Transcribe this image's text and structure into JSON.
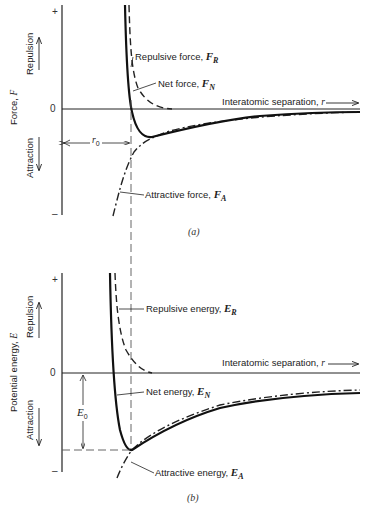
{
  "panel_a": {
    "caption": "(a)",
    "y_axis_label": "Force, ",
    "y_axis_symbol": "F",
    "repulsion_label": "Repulsion",
    "attraction_label": "Attraction",
    "tick_plus": "+",
    "tick_zero": "0",
    "tick_minus": "–",
    "x_axis_label": "Interatomic separation, ",
    "x_axis_symbol": "r",
    "curves": {
      "repulsive": {
        "label": "Repulsive force, ",
        "symbol": "F",
        "subscript": "R",
        "style": "dashed"
      },
      "net": {
        "label": "Net force, ",
        "symbol": "F",
        "subscript": "N",
        "style": "solid"
      },
      "attractive": {
        "label": "Attractive force, ",
        "symbol": "F",
        "subscript": "A",
        "style": "dash-dot"
      }
    },
    "equilibrium_label": "r",
    "equilibrium_subscript": "0"
  },
  "panel_b": {
    "caption": "(b)",
    "y_axis_label": "Potential energy, ",
    "y_axis_symbol": "E",
    "repulsion_label": "Repulsion",
    "attraction_label": "Attraction",
    "tick_plus": "+",
    "tick_zero": "0",
    "tick_minus": "–",
    "x_axis_label": "Interatomic separation, ",
    "x_axis_symbol": "r",
    "curves": {
      "repulsive": {
        "label": "Repulsive energy, ",
        "symbol": "E",
        "subscript": "R",
        "style": "dashed"
      },
      "net": {
        "label": "Net energy, ",
        "symbol": "E",
        "subscript": "N",
        "style": "solid"
      },
      "attractive": {
        "label": "Attractive energy, ",
        "symbol": "E",
        "subscript": "A",
        "style": "dash-dot"
      }
    },
    "well_depth_label": "E",
    "well_depth_subscript": "0"
  }
}
